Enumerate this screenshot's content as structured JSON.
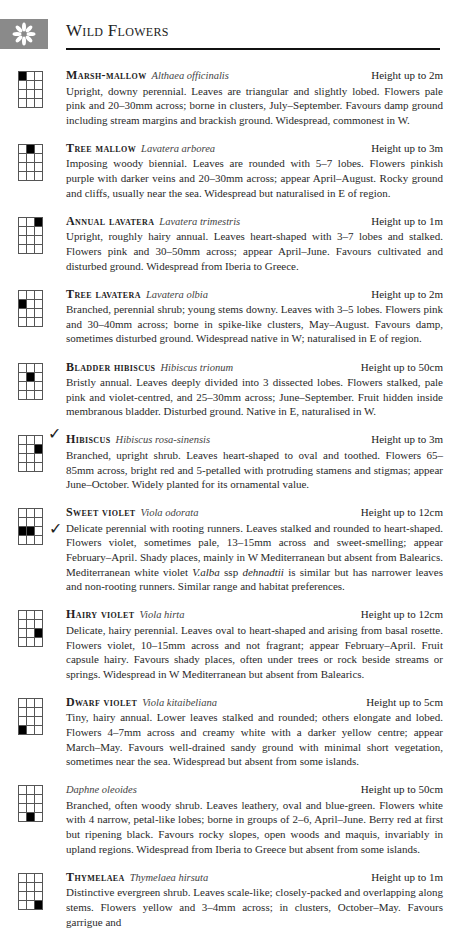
{
  "header": {
    "title": "Wild Flowers",
    "icon": "flower-icon",
    "tab_color": "#8a8a8a"
  },
  "entries": [
    {
      "common_name": "Marsh-mallow",
      "latin_name": "Althaea officinalis",
      "height": "Height up to 2m",
      "grid_filled": [
        0,
        0
      ],
      "checked": false,
      "description": "Upright, downy perennial. Leaves are triangular and slightly lobed. Flowers pale pink and 20–30mm across; borne in clusters, July–September. Favours damp ground including stream margins and brackish ground. Widespread, commonest in W."
    },
    {
      "common_name": "Tree mallow",
      "latin_name": "Lavatera arborea",
      "height": "Height up to 3m",
      "grid_filled": [
        0,
        1
      ],
      "checked": false,
      "description": "Imposing woody biennial. Leaves are rounded with 5–7 lobes. Flowers pinkish purple with darker veins and 20–30mm across; appear April–August. Rocky ground and cliffs, usually near the sea. Widespread but naturalised in E of region."
    },
    {
      "common_name": "Annual lavatera",
      "latin_name": "Lavatera trimestris",
      "height": "Height up to 1m",
      "grid_filled": [
        0,
        2
      ],
      "checked": false,
      "description": "Upright, roughly hairy annual. Leaves heart-shaped with 3–7 lobes and stalked. Flowers pink and 30–50mm across; appear April–June. Favours cultivated and disturbed ground. Widespread from Iberia to Greece."
    },
    {
      "common_name": "Tree lavatera",
      "latin_name": "Lavatera olbia",
      "height": "Height up to 2m",
      "grid_filled": [
        1,
        0
      ],
      "checked": false,
      "description": "Branched, perennial shrub; young stems downy. Leaves with 3–5 lobes. Flowers pink and 30–40mm across; borne in spike-like clusters, May–August. Favours damp, sometimes disturbed ground. Widespread native in W; naturalised in E of region."
    },
    {
      "common_name": "Bladder hibiscus",
      "latin_name": "Hibiscus trionum",
      "height": "Height up to 50cm",
      "grid_filled": [
        1,
        1
      ],
      "checked": false,
      "description": "Bristly annual. Leaves deeply divided into 3 dissected lobes. Flowers stalked, pale pink and violet-centred, and 25–30mm across; June–September. Fruit hidden inside membranous bladder. Disturbed ground. Native in E, naturalised in W."
    },
    {
      "common_name": "Hibiscus",
      "latin_name": "Hibiscus rosa-sinensis",
      "height": "Height up to 3m",
      "grid_filled": [
        1,
        2
      ],
      "checked": true,
      "description": "Branched, upright shrub. Leaves heart-shaped to oval and toothed. Flowers 65–85mm across, bright red and 5-petalled with protruding stamens and stigmas; appear June–October. Widely planted for its ornamental value."
    },
    {
      "common_name": "Sweet violet",
      "latin_name": "Viola odorata",
      "height": "Height up to 12cm",
      "grid_filled": [
        2,
        0,
        2,
        1
      ],
      "checked": true,
      "description_parts": {
        "before": "Delicate perennial with rooting runners. Leaves stalked and rounded to heart-shaped. Flowers violet, sometimes pale, 13–15mm across and sweet-smelling; appear February–April. Shady places, mainly in W Mediterranean but absent from Balearics. Mediterranean white violet ",
        "italic1": "V.alba",
        "middle": " ssp ",
        "italic2": "dehnadtii",
        "after": " is similar but has narrower leaves and non-rooting runners. Similar range and habitat preferences."
      }
    },
    {
      "common_name": "Hairy violet",
      "latin_name": "Viola hirta",
      "height": "Height up to 12cm",
      "grid_filled": [
        2,
        2
      ],
      "checked": false,
      "description": "Delicate, hairy perennial. Leaves oval to heart-shaped and arising from basal rosette. Flowers violet, 10–15mm across and not fragrant; appear February–April. Fruit capsule hairy. Favours shady places, often under trees or rock beside streams or springs. Widespread in W Mediterranean but absent from Balearics."
    },
    {
      "common_name": "Dwarf violet",
      "latin_name": "Viola kitaibeliana",
      "height": "Height up to 5cm",
      "grid_filled": [
        3,
        0
      ],
      "checked": false,
      "description": "Tiny, hairy annual. Lower leaves stalked and rounded; others elongate and lobed. Flowers 4–7mm across and creamy white with a darker yellow centre; appear March–May. Favours well-drained sandy ground with minimal short vegetation, sometimes near the sea. Widespread but absent from some islands."
    },
    {
      "common_name": "",
      "latin_name": "Daphne oleoides",
      "height": "Height up to 50cm",
      "grid_filled": [
        3,
        1
      ],
      "checked": false,
      "description": "Branched, often woody shrub. Leaves leathery, oval and blue-green. Flowers white with 4 narrow, petal-like lobes; borne in groups of 2–6, April–June. Berry red at first but ripening black. Favours rocky slopes, open woods and maquis, invariably in upland regions. Widespread from Iberia to Greece but absent from some islands."
    },
    {
      "common_name": "Thymelaea",
      "latin_name": "Thymelaea hirsuta",
      "height": "Height up to 1m",
      "grid_filled": [
        3,
        2
      ],
      "checked": false,
      "description": "Distinctive evergreen shrub. Leaves scale-like; closely-packed and overlapping along stems. Flowers yellow and 3–4mm across; in clusters, October–May. Favours garrigue and"
    }
  ]
}
